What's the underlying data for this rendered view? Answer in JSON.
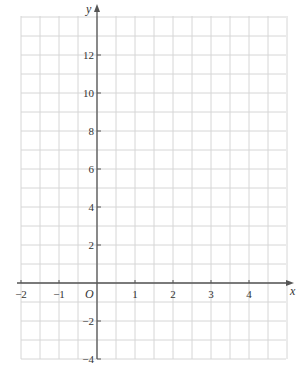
{
  "chart_data": {
    "type": "line",
    "title": "",
    "xlabel": "x",
    "ylabel": "y",
    "origin_label": "O",
    "xlim": [
      -2,
      4.5
    ],
    "ylim": [
      -4,
      14
    ],
    "x_ticks": [
      -2,
      -1,
      1,
      2,
      3,
      4
    ],
    "x_tick_labels": [
      "−2",
      "−1",
      "1",
      "2",
      "3",
      "4"
    ],
    "y_ticks": [
      -4,
      -2,
      2,
      4,
      6,
      8,
      10,
      12
    ],
    "y_tick_labels": [
      "−4",
      "−2",
      "2",
      "4",
      "6",
      "8",
      "10",
      "12"
    ],
    "grid": true,
    "grid_step_x": 0.5,
    "grid_step_y": 1,
    "series": [],
    "colors": {
      "grid": "#d6d6d6",
      "axis": "#555555",
      "text": "#333333"
    }
  }
}
